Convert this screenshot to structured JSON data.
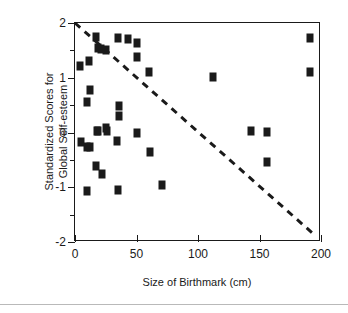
{
  "chart_data": {
    "type": "scatter",
    "title": "",
    "xlabel": "Size of Birthmark (cm)",
    "ylabel": "Standardized Scores for Global Self-esteem",
    "ylabel_lines": [
      "Standardized Scores for",
      "Global Self-esteem"
    ],
    "xlim": [
      0,
      200
    ],
    "ylim": [
      -2,
      2
    ],
    "xticks": [
      0,
      50,
      100,
      150,
      200
    ],
    "xtick_labels": [
      "0",
      "50",
      "100",
      "150",
      "200"
    ],
    "yticks": [
      -2,
      -1,
      0,
      1,
      2
    ],
    "ytick_labels": [
      "-2",
      "-1",
      "0",
      "1",
      "2"
    ],
    "yticks_minor": [
      -1.5,
      -0.5,
      0.5,
      1.5
    ],
    "grid": false,
    "legend": null,
    "marker": {
      "shape": "square",
      "color": "#1a1a1a",
      "size_px": 7
    },
    "points": [
      {
        "x": 4,
        "y": 1.22
      },
      {
        "x": 11,
        "y": 1.3
      },
      {
        "x": 12,
        "y": 0.77
      },
      {
        "x": 10,
        "y": 0.56
      },
      {
        "x": 5,
        "y": -0.18
      },
      {
        "x": 10,
        "y": -0.27
      },
      {
        "x": 12,
        "y": -0.27
      },
      {
        "x": 10,
        "y": -1.06
      },
      {
        "x": 17,
        "y": 1.74
      },
      {
        "x": 19,
        "y": 1.54
      },
      {
        "x": 21,
        "y": 1.52
      },
      {
        "x": 25,
        "y": 1.5
      },
      {
        "x": 18,
        "y": 0.03
      },
      {
        "x": 19,
        "y": 0.02
      },
      {
        "x": 17,
        "y": -0.62
      },
      {
        "x": 22,
        "y": -0.76
      },
      {
        "x": 25,
        "y": 0.08
      },
      {
        "x": 26,
        "y": 0.02
      },
      {
        "x": 35,
        "y": 1.73
      },
      {
        "x": 36,
        "y": 0.49
      },
      {
        "x": 36,
        "y": 0.31
      },
      {
        "x": 34,
        "y": -0.16
      },
      {
        "x": 35,
        "y": -1.05
      },
      {
        "x": 43,
        "y": 1.7
      },
      {
        "x": 50,
        "y": 1.64
      },
      {
        "x": 50,
        "y": 1.38
      },
      {
        "x": 50,
        "y": 0.0
      },
      {
        "x": 60,
        "y": 1.1
      },
      {
        "x": 61,
        "y": -0.35
      },
      {
        "x": 71,
        "y": -0.95
      },
      {
        "x": 112,
        "y": 1.01
      },
      {
        "x": 143,
        "y": 0.03
      },
      {
        "x": 156,
        "y": 0.01
      },
      {
        "x": 156,
        "y": -0.54
      },
      {
        "x": 191,
        "y": 1.72
      },
      {
        "x": 191,
        "y": 1.1
      }
    ],
    "trend_line": {
      "style": "dashed",
      "color": "#1a1a1a",
      "width_px": 3,
      "x0": 0,
      "y0": 2.0,
      "x1": 196,
      "y1": -1.9
    }
  }
}
